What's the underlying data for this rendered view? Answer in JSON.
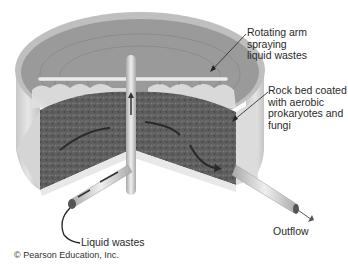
{
  "figure": {
    "labels": {
      "rotating_arm": "Rotating arm spraying\nliquid wastes",
      "rock_bed": "Rock bed coated\nwith aerobic\nprokaryotes and\nfungi",
      "liquid_wastes": "Liquid wastes",
      "outflow": "Outflow"
    },
    "credit": "© Pearson Education, Inc."
  },
  "colors": {
    "tank_wall": "#d9d9d9",
    "tank_rim": "#b8b8b8",
    "interior": "#9a9a9a",
    "rock_bed": "#5e5e5e",
    "spray": "#e4e4e4",
    "pipe": "#cfcfcf",
    "text": "#2a2a2a"
  }
}
